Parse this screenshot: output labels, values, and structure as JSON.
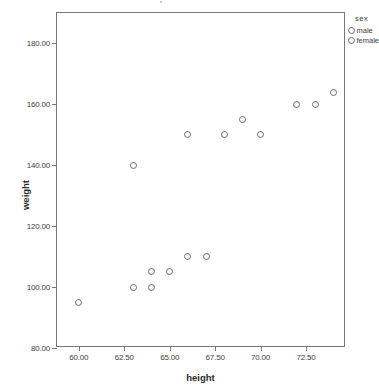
{
  "chart_data": {
    "type": "scatter",
    "title": "",
    "xlabel": "height",
    "ylabel": "weight",
    "xlim": [
      58.8,
      74.7
    ],
    "ylim": [
      80,
      190
    ],
    "xticks": [
      "60.00",
      "62.50",
      "65.00",
      "67.50",
      "70.00",
      "72.50"
    ],
    "xtick_values": [
      60.0,
      62.5,
      65.0,
      67.5,
      70.0,
      72.5
    ],
    "yticks": [
      "80.00",
      "100.00",
      "120.00",
      "140.00",
      "160.00",
      "180.00"
    ],
    "ytick_values": [
      80,
      100,
      120,
      140,
      160,
      180
    ],
    "grid": false,
    "legend_position": "right-top",
    "legend_title": "sex",
    "series": [
      {
        "name": "male",
        "marker": "open-circle",
        "color": "#6b6b7a",
        "points": []
      },
      {
        "name": "female",
        "marker": "open-circle",
        "color": "#6b6b7a",
        "points": []
      }
    ],
    "points": [
      {
        "x": 60.0,
        "y": 95
      },
      {
        "x": 63.0,
        "y": 100
      },
      {
        "x": 63.0,
        "y": 140
      },
      {
        "x": 64.0,
        "y": 100
      },
      {
        "x": 64.0,
        "y": 105
      },
      {
        "x": 65.0,
        "y": 105
      },
      {
        "x": 66.0,
        "y": 110
      },
      {
        "x": 66.0,
        "y": 150
      },
      {
        "x": 67.0,
        "y": 110
      },
      {
        "x": 68.0,
        "y": 150
      },
      {
        "x": 69.0,
        "y": 155
      },
      {
        "x": 70.0,
        "y": 150
      },
      {
        "x": 72.0,
        "y": 160
      },
      {
        "x": 73.0,
        "y": 160
      },
      {
        "x": 74.0,
        "y": 164
      }
    ]
  },
  "legend": {
    "title": "sex",
    "items": [
      {
        "label": "male"
      },
      {
        "label": "female"
      }
    ]
  },
  "axes": {
    "x_title": "height",
    "y_title": "weight"
  }
}
